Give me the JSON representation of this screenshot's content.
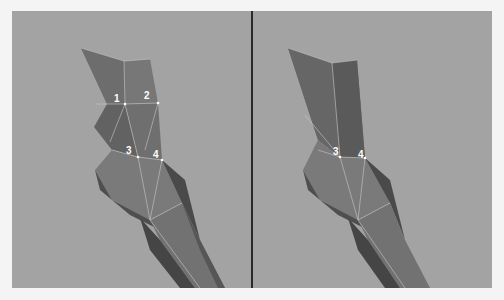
{
  "figure": {
    "background_color": "#f4f4f4",
    "viewport_color": "#a3a3a3",
    "divider_color": "#2a2a2a",
    "mesh_colors": {
      "light": "#7e7e7e",
      "mid": "#6c6c6c",
      "dark": "#555555",
      "darker": "#474747",
      "edge": "#c8c8c8"
    },
    "left_view": {
      "vertex_labels": [
        {
          "label": "1",
          "x": 118,
          "y": 103
        },
        {
          "label": "2",
          "x": 148,
          "y": 99
        },
        {
          "label": "3",
          "x": 130,
          "y": 152
        },
        {
          "label": "4",
          "x": 156,
          "y": 155
        }
      ]
    },
    "right_view": {
      "vertex_labels": [
        {
          "label": "3",
          "x": 338,
          "y": 152
        },
        {
          "label": "4",
          "x": 362,
          "y": 155
        }
      ]
    }
  }
}
